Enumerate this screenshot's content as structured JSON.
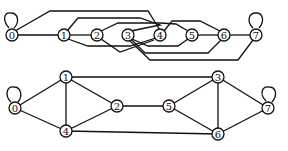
{
  "diagrams": [
    {
      "name": "linear-layout",
      "nodes": [
        {
          "id": "0",
          "label": "0",
          "x": 12,
          "y": 35
        },
        {
          "id": "1",
          "label": "1",
          "x": 64,
          "y": 35
        },
        {
          "id": "2",
          "label": "2",
          "x": 97,
          "y": 35
        },
        {
          "id": "3",
          "label": "3",
          "x": 128,
          "y": 35
        },
        {
          "id": "4",
          "label": "4",
          "x": 160,
          "y": 35
        },
        {
          "id": "5",
          "label": "5",
          "x": 192,
          "y": 35
        },
        {
          "id": "6",
          "label": "6",
          "x": 224,
          "y": 35
        },
        {
          "id": "7",
          "label": "7",
          "x": 256,
          "y": 35
        }
      ],
      "edges": [
        {
          "from": "0",
          "to": "0",
          "d": "M9,28 C2,20 4,12 11,13 C18,13 20,22 14,28"
        },
        {
          "from": "0",
          "to": "1",
          "d": "M17,35 L59,35"
        },
        {
          "from": "1",
          "to": "2",
          "d": "M69,35 L92,35"
        },
        {
          "from": "5",
          "to": "6",
          "d": "M197,35 L219,35"
        },
        {
          "from": "6",
          "to": "7",
          "d": "M229,35 L251,35"
        },
        {
          "from": "7",
          "to": "7",
          "d": "M253,28 C246,21 249,13 256,13 C263,13 265,21 259,28"
        },
        {
          "from": "0",
          "to": "4",
          "d": "M15,31 L50,11 L148,11 L160,30"
        },
        {
          "from": "1",
          "to": "3",
          "d": "M67,31 L78,18 L140,18 L160,25 L131,31"
        },
        {
          "from": "1",
          "to": "4",
          "d": "M68,39 L88,46 L130,46 L156,38"
        },
        {
          "from": "2",
          "to": "5",
          "d": "M101,31 L118,23 L160,23 L176,24 L188,31"
        },
        {
          "from": "2",
          "to": "4",
          "d": "M101,39 L120,52 L154,40"
        },
        {
          "from": "3",
          "to": "6",
          "d": "M131,39 L145,53 L208,53 L221,40"
        },
        {
          "from": "3",
          "to": "5",
          "d": "M132,39 L148,46 L178,46 L188,39"
        },
        {
          "from": "4",
          "to": "6",
          "d": "M164,31 L172,21 L200,21 L220,31"
        },
        {
          "from": "3",
          "to": "7",
          "d": "M129,40 L150,60 L238,60 L253,40"
        }
      ]
    },
    {
      "name": "planar-layout",
      "nodes": [
        {
          "id": "0",
          "label": "0",
          "x": 15,
          "y": 108
        },
        {
          "id": "1",
          "label": "1",
          "x": 66,
          "y": 77
        },
        {
          "id": "2",
          "label": "2",
          "x": 117,
          "y": 106
        },
        {
          "id": "3",
          "label": "3",
          "x": 218,
          "y": 77
        },
        {
          "id": "4",
          "label": "4",
          "x": 66,
          "y": 131
        },
        {
          "id": "5",
          "label": "5",
          "x": 169,
          "y": 106
        },
        {
          "id": "6",
          "label": "6",
          "x": 218,
          "y": 134
        },
        {
          "id": "7",
          "label": "7",
          "x": 268,
          "y": 108
        }
      ],
      "edges": [
        {
          "from": "0",
          "to": "0",
          "d": "M11,102 C4,95 7,86 14,87 C21,87 23,96 18,102"
        },
        {
          "from": "0",
          "to": "1",
          "d": "M15,108 L66,77"
        },
        {
          "from": "0",
          "to": "4",
          "d": "M15,108 L66,131"
        },
        {
          "from": "1",
          "to": "4",
          "d": "M66,77 L66,131"
        },
        {
          "from": "1",
          "to": "2",
          "d": "M66,77 L117,106"
        },
        {
          "from": "2",
          "to": "4",
          "d": "M117,106 L66,131"
        },
        {
          "from": "1",
          "to": "3",
          "d": "M66,77 L218,77"
        },
        {
          "from": "2",
          "to": "5",
          "d": "M117,106 L169,106"
        },
        {
          "from": "4",
          "to": "6",
          "d": "M66,131 L218,134"
        },
        {
          "from": "3",
          "to": "5",
          "d": "M218,77 L169,106"
        },
        {
          "from": "5",
          "to": "6",
          "d": "M169,106 L218,134"
        },
        {
          "from": "3",
          "to": "6",
          "d": "M218,77 L218,134"
        },
        {
          "from": "3",
          "to": "7",
          "d": "M218,77 L268,108"
        },
        {
          "from": "6",
          "to": "7",
          "d": "M218,134 L268,108"
        },
        {
          "from": "7",
          "to": "7",
          "d": "M266,101 C259,94 262,86 269,87 C276,87 278,95 272,102"
        }
      ]
    }
  ]
}
